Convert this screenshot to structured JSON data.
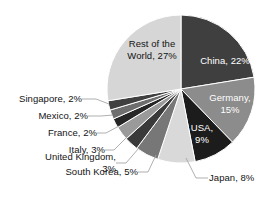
{
  "chart_data": {
    "type": "pie",
    "title": "",
    "xlabel": "",
    "ylabel": "",
    "legend_position": "none",
    "grid": false,
    "value_unit": "%",
    "total": 100,
    "categories": [
      "China",
      "Germany",
      "USA",
      "Japan",
      "South Korea",
      "United Kingdom",
      "Italy",
      "France",
      "Mexico",
      "Singapore",
      "Rest of the World"
    ],
    "values": [
      22,
      15,
      9,
      8,
      5,
      3,
      3,
      2,
      2,
      2,
      27
    ],
    "colors": [
      "#3f3f3f",
      "#8c8c8c",
      "#1c1c1c",
      "#d9d9d9",
      "#777777",
      "#3a3a3a",
      "#9a9a9a",
      "#262626",
      "#6e6e6e",
      "#404040",
      "#d6d6d6"
    ],
    "slices": [
      {
        "label": "China, 22%",
        "name": "China",
        "value": 22,
        "color": "#3f3f3f",
        "label_placement": "inside",
        "text_color": "#ffffff"
      },
      {
        "label": "Germany, 15%",
        "name": "Germany",
        "value": 15,
        "color": "#8c8c8c",
        "label_placement": "inside",
        "text_color": "#ffffff"
      },
      {
        "label": "USA, 9%",
        "name": "USA",
        "value": 9,
        "color": "#1c1c1c",
        "label_placement": "inside",
        "text_color": "#ffffff"
      },
      {
        "label": "Japan, 8%",
        "name": "Japan",
        "value": 8,
        "color": "#d9d9d9",
        "label_placement": "outside",
        "text_color": "#131313"
      },
      {
        "label": "South Korea, 5%",
        "name": "South Korea",
        "value": 5,
        "color": "#777777",
        "label_placement": "outside",
        "text_color": "#131313"
      },
      {
        "label": "United Kingdom, 3%",
        "name": "United Kingdom",
        "value": 3,
        "color": "#3a3a3a",
        "label_placement": "outside",
        "text_color": "#131313"
      },
      {
        "label": "Italy, 3%",
        "name": "Italy",
        "value": 3,
        "color": "#9a9a9a",
        "label_placement": "outside",
        "text_color": "#131313"
      },
      {
        "label": "France, 2%",
        "name": "France",
        "value": 2,
        "color": "#262626",
        "label_placement": "outside",
        "text_color": "#131313"
      },
      {
        "label": "Mexico, 2%",
        "name": "Mexico",
        "value": 2,
        "color": "#6e6e6e",
        "label_placement": "outside",
        "text_color": "#131313"
      },
      {
        "label": "Singapore, 2%",
        "name": "Singapore",
        "value": 2,
        "color": "#404040",
        "label_placement": "outside",
        "text_color": "#131313"
      },
      {
        "label": "Rest of the World, 27%",
        "name": "Rest of the World",
        "value": 27,
        "color": "#d6d6d6",
        "label_placement": "inside",
        "text_color": "#131313"
      }
    ]
  },
  "labels": {
    "china_line1": "China, 22%",
    "germany_line1": "Germany,",
    "germany_line2": "15%",
    "usa_line1": "USA,",
    "usa_line2": "9%",
    "rest_line1": "Rest of the",
    "rest_line2": "World, 27%",
    "japan": "Japan, 8%",
    "south_korea": "South Korea, 5%",
    "uk_line1": "United Kingdom,",
    "uk_line2": "3%",
    "italy": "Italy, 3%",
    "france": "France, 2%",
    "mexico": "Mexico, 2%",
    "singapore": "Singapore, 2%"
  },
  "style": {
    "background": "#ffffff",
    "slice_border": "#ffffff",
    "leader_line_color": "#a6a6a6"
  }
}
